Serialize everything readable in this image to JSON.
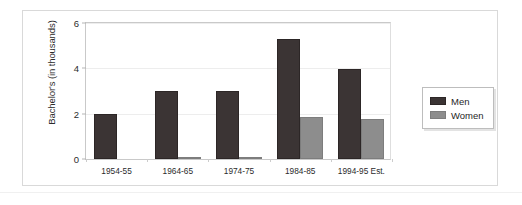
{
  "chart_data": {
    "type": "bar",
    "title": "",
    "xlabel": "",
    "ylabel": "Bachelor's (in thousands)",
    "categories": [
      "1954-55",
      "1964-65",
      "1974-75",
      "1984-85",
      "1994-95 Est."
    ],
    "series": [
      {
        "name": "Men",
        "color": "#3b3434",
        "values": [
          2.0,
          3.0,
          3.0,
          5.3,
          3.95
        ]
      },
      {
        "name": "Women",
        "color": "#8d8d8d",
        "values": [
          0.0,
          0.02,
          0.1,
          1.87,
          1.76
        ]
      }
    ],
    "ylim": [
      0,
      6
    ],
    "yticks": [
      0,
      2,
      4,
      6
    ],
    "ytick_labels": [
      "0",
      "2",
      "4",
      "6"
    ],
    "grid": false,
    "legend_position": "right-outside",
    "legend_entries": [
      "Men",
      "Women"
    ]
  },
  "legend": {
    "men_label": "Men",
    "women_label": "Women"
  },
  "axis": {
    "y_title": "Bachelor's (in thousands)",
    "y_labels": [
      "0",
      "2",
      "4",
      "6"
    ],
    "x_labels": [
      "1954-55",
      "1964-65",
      "1974-75",
      "1984-85",
      "1994-95 Est."
    ]
  },
  "caption": {
    "text": ""
  }
}
